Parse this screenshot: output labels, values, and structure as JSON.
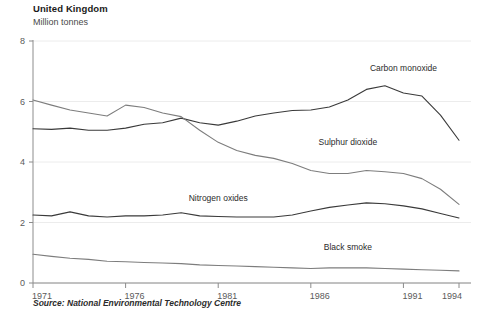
{
  "header": {
    "title": "United Kingdom",
    "subtitle": "Million tonnes"
  },
  "footer": {
    "source": "Source: National Environmental Technology Centre"
  },
  "chart_data": {
    "type": "line",
    "title": "United Kingdom",
    "subtitle": "Million tonnes",
    "xlabel": "",
    "ylabel": "Million tonnes",
    "xlim": [
      1971,
      1994
    ],
    "ylim": [
      0,
      8
    ],
    "yticks": [
      0,
      2,
      4,
      6,
      8
    ],
    "ytick_labels": [
      "0",
      "2",
      "4",
      "6",
      "8"
    ],
    "xticks": [
      1971,
      1976,
      1981,
      1986,
      1991,
      1994
    ],
    "xtick_labels": [
      "1971",
      "1976",
      "1981",
      "1986",
      "1991",
      "1994"
    ],
    "grid": "horizontal",
    "legend": "inline-labels",
    "x": [
      1971,
      1972,
      1973,
      1974,
      1975,
      1976,
      1977,
      1978,
      1979,
      1980,
      1981,
      1982,
      1983,
      1984,
      1985,
      1986,
      1987,
      1988,
      1989,
      1990,
      1991,
      1992,
      1993,
      1994
    ],
    "series": [
      {
        "name": "Carbon monoxide",
        "color": "#3a3a3a",
        "label_x": 1991,
        "label_y": 7.0,
        "values": [
          5.1,
          5.08,
          5.12,
          5.05,
          5.05,
          5.12,
          5.25,
          5.3,
          5.45,
          5.3,
          5.22,
          5.35,
          5.52,
          5.62,
          5.7,
          5.72,
          5.82,
          6.05,
          6.4,
          6.52,
          6.28,
          6.18,
          5.55,
          4.72
        ]
      },
      {
        "name": "Sulphur dioxide",
        "color": "#7d7d7d",
        "label_x": 1988,
        "label_y": 4.55,
        "values": [
          6.05,
          5.88,
          5.72,
          5.62,
          5.52,
          5.88,
          5.8,
          5.62,
          5.5,
          5.05,
          4.65,
          4.38,
          4.22,
          4.12,
          3.95,
          3.72,
          3.62,
          3.62,
          3.72,
          3.68,
          3.62,
          3.45,
          3.1,
          2.6
        ]
      },
      {
        "name": "Nitrogen oxides",
        "color": "#3a3a3a",
        "label_x": 1981,
        "label_y": 2.72,
        "values": [
          2.25,
          2.22,
          2.35,
          2.22,
          2.18,
          2.22,
          2.22,
          2.25,
          2.32,
          2.22,
          2.2,
          2.18,
          2.18,
          2.18,
          2.25,
          2.38,
          2.5,
          2.58,
          2.65,
          2.62,
          2.55,
          2.45,
          2.3,
          2.15
        ]
      },
      {
        "name": "Black smoke",
        "color": "#7d7d7d",
        "label_x": 1988,
        "label_y": 1.1,
        "values": [
          0.95,
          0.88,
          0.82,
          0.78,
          0.72,
          0.7,
          0.68,
          0.66,
          0.64,
          0.6,
          0.58,
          0.56,
          0.54,
          0.52,
          0.5,
          0.48,
          0.5,
          0.5,
          0.5,
          0.48,
          0.46,
          0.44,
          0.42,
          0.4
        ]
      }
    ]
  }
}
